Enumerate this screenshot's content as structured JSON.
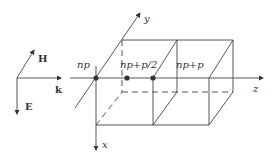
{
  "diagram": {
    "type": "3d-periodic-structure",
    "triad": {
      "h_label": "H",
      "k_label": "k",
      "e_label": "E"
    },
    "axes": {
      "x_label": "x",
      "y_label": "y",
      "z_label": "z"
    },
    "points": [
      {
        "label": "np"
      },
      {
        "label": "np+p/2"
      },
      {
        "label": "np+p"
      }
    ],
    "colors": {
      "line": "#444444",
      "text": "#333333",
      "dot": "#333333"
    }
  }
}
